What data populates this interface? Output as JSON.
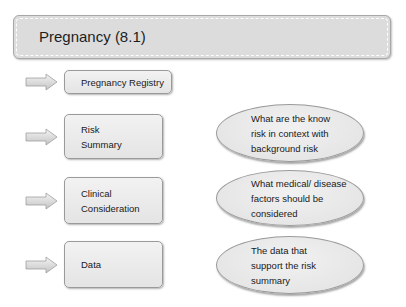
{
  "header": {
    "title": "Pregnancy (8.1)"
  },
  "rows": [
    {
      "arrow_icon": "right-arrow-icon",
      "box_lines": [
        "Pregnancy Registry"
      ]
    },
    {
      "arrow_icon": "right-arrow-icon",
      "box_lines": [
        "Risk",
        "Summary"
      ],
      "ellipse_lines": [
        "What are the know",
        "risk in context with",
        "background risk"
      ]
    },
    {
      "arrow_icon": "right-arrow-icon",
      "box_lines": [
        "Clinical",
        "Consideration"
      ],
      "ellipse_lines": [
        "What medical/ disease",
        "factors should be",
        "considered"
      ]
    },
    {
      "arrow_icon": "right-arrow-icon",
      "box_lines": [
        "Data"
      ],
      "ellipse_lines": [
        "The data that",
        "support the risk",
        "summary"
      ]
    }
  ],
  "colors": {
    "fill": "#dcdcdc",
    "box_fill": "#eaeaea",
    "border": "#9a9a9a",
    "text": "#1a1a1a"
  }
}
